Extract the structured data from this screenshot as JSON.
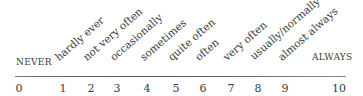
{
  "scale": {
    "min_label": "NEVER",
    "max_label": "ALWAYS",
    "numbers": [
      "0",
      "1",
      "2",
      "3",
      "4",
      "5",
      "6",
      "7",
      "8",
      "9",
      "10"
    ],
    "frequency_labels": [
      "hardly ever",
      "not very often",
      "occasionally",
      "sometimes",
      "quite often",
      "often",
      "very often",
      "usually/normally",
      "almost always"
    ]
  }
}
